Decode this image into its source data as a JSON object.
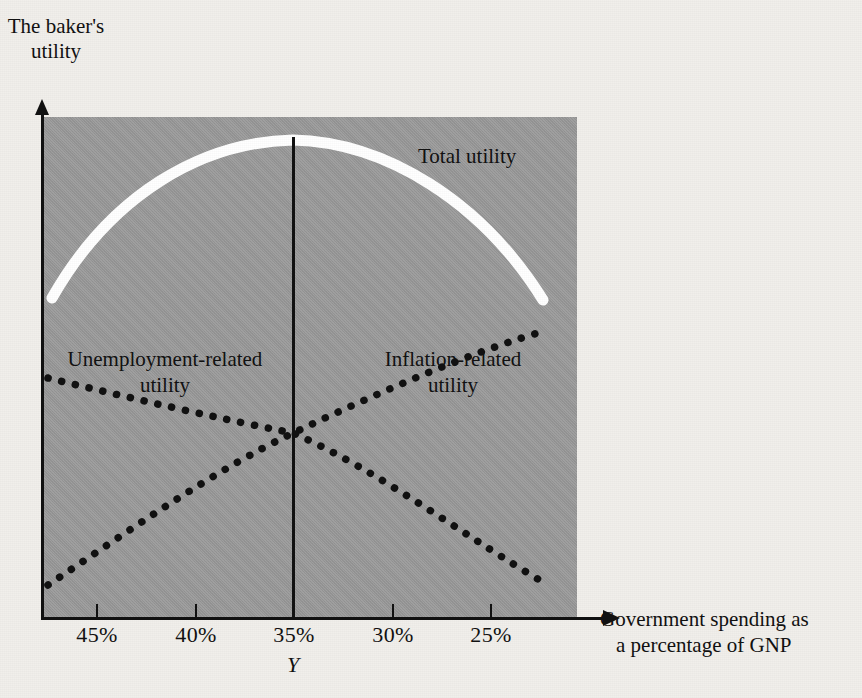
{
  "figure": {
    "y_axis_title": "The baker's utility",
    "x_axis_title_line1": "Government spending as",
    "x_axis_title_line2": "a percentage of GNP",
    "marker_label": "Y"
  },
  "labels": {
    "total": "Total utility",
    "unemployment_line1": "Unemployment-related",
    "unemployment_line2": "utility",
    "inflation_line1": "Inflation-related",
    "inflation_line2": "utility"
  },
  "ticks": [
    {
      "label": "45%",
      "x": 96
    },
    {
      "label": "40%",
      "x": 195
    },
    {
      "label": "35%",
      "x": 293
    },
    {
      "label": "30%",
      "x": 392
    },
    {
      "label": "25%",
      "x": 490
    }
  ],
  "colors": {
    "plot_background": "#9c9c9c",
    "page_background": "#f1efeb",
    "total_utility_curve": "#ffffff",
    "dotted_curves": "#111111",
    "axis": "#111111"
  },
  "chart_data": {
    "type": "line",
    "title": "",
    "xlabel": "Government spending as a percentage of GNP",
    "ylabel": "The baker's utility",
    "x_tick_labels": [
      "45%",
      "40%",
      "35%",
      "30%",
      "25%"
    ],
    "x_axis_direction": "descending",
    "grid": false,
    "legend": "inline-annotations",
    "y_tick_labels": [],
    "annotations": [
      {
        "text": "Y",
        "at_x": "35%",
        "meaning": "optimum level of government spending"
      }
    ],
    "series": [
      {
        "name": "Total utility",
        "style": "thick-solid-white",
        "shape": "concave-down parabola peaking at 35%",
        "x": [
          "46%",
          "44%",
          "42%",
          "40%",
          "38%",
          "36%",
          "35%",
          "34%",
          "32%",
          "30%",
          "28%",
          "26%",
          "24%"
        ],
        "values": [
          23,
          42,
          58,
          71,
          82,
          88,
          90,
          89,
          84,
          75,
          62,
          45,
          22
        ]
      },
      {
        "name": "Inflation-related utility",
        "style": "dotted-black",
        "shape": "increasing, concave-down, left to right",
        "x": [
          "46%",
          "44%",
          "42%",
          "40%",
          "38%",
          "36%",
          "35%",
          "34%",
          "32%",
          "30%",
          "28%",
          "26%",
          "24%"
        ],
        "values": [
          7,
          14,
          21,
          27,
          33,
          37,
          39,
          41,
          45,
          49,
          53,
          56,
          59
        ]
      },
      {
        "name": "Unemployment-related utility",
        "style": "dotted-black",
        "shape": "decreasing, left to right",
        "x": [
          "46%",
          "44%",
          "42%",
          "40%",
          "38%",
          "36%",
          "35%",
          "34%",
          "32%",
          "30%",
          "28%",
          "26%",
          "24%"
        ],
        "values": [
          66,
          62,
          57,
          52,
          47,
          42,
          39,
          36,
          31,
          25,
          20,
          14,
          8
        ]
      }
    ],
    "intersection": {
      "x": "35%",
      "note": "inflation-related and unemployment-related utility curves cross at Y"
    }
  }
}
